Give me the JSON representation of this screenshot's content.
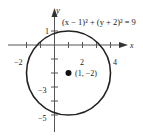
{
  "diagram": {
    "equation": "(x − 1)² + (y + 2)² = 9",
    "axis_x_label": "x",
    "axis_y_label": "y",
    "center_label": "(1, −2)",
    "tick_labels": {
      "x_neg2": "−2",
      "x_2": "2",
      "x_4": "4",
      "y_1": "1",
      "y_neg3": "−3",
      "y_neg5": "−5"
    },
    "circle": {
      "center": [
        1,
        -2
      ],
      "radius": 3
    },
    "colors": {
      "stroke": "#222222",
      "axis": "#555555"
    }
  }
}
